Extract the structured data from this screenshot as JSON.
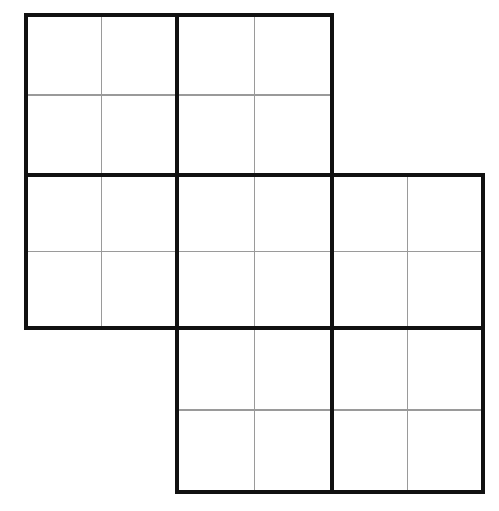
{
  "figure": {
    "type": "grid-diagram",
    "background_color": "#ffffff",
    "thick_line_color": "#111111",
    "thin_line_color": "#9a9a9a",
    "thick_line_width": 3.4,
    "thin_line_width": 1.1,
    "canvas": {
      "width": 499,
      "height": 511
    }
  },
  "grid": {
    "block_columns_x": [
      26,
      177,
      332,
      483
    ],
    "block_rows_y": [
      15,
      175,
      328,
      492
    ],
    "block_cols_count": 3,
    "block_rows_count": 3,
    "cells_per_block": 4,
    "subdivision": "2x2",
    "occupied_blocks": [
      {
        "name": "block-r0-c0",
        "row": 0,
        "col": 0,
        "x": 26,
        "y": 15,
        "w": 151,
        "h": 160
      },
      {
        "name": "block-r0-c1",
        "row": 0,
        "col": 1,
        "x": 177,
        "y": 15,
        "w": 155,
        "h": 160
      },
      {
        "name": "block-r1-c0",
        "row": 1,
        "col": 0,
        "x": 26,
        "y": 175,
        "w": 151,
        "h": 153
      },
      {
        "name": "block-r1-c1",
        "row": 1,
        "col": 1,
        "x": 177,
        "y": 175,
        "w": 155,
        "h": 153
      },
      {
        "name": "block-r1-c2",
        "row": 1,
        "col": 2,
        "x": 332,
        "y": 175,
        "w": 151,
        "h": 153
      },
      {
        "name": "block-r2-c1",
        "row": 2,
        "col": 1,
        "x": 177,
        "y": 328,
        "w": 155,
        "h": 164
      },
      {
        "name": "block-r2-c2",
        "row": 2,
        "col": 2,
        "x": 332,
        "y": 328,
        "w": 151,
        "h": 164
      }
    ],
    "empty_blocks": [
      {
        "name": "block-r0-c2",
        "row": 0,
        "col": 2
      },
      {
        "name": "block-r2-c0",
        "row": 2,
        "col": 0
      }
    ],
    "total_blocks": 7,
    "total_cells": 28
  }
}
